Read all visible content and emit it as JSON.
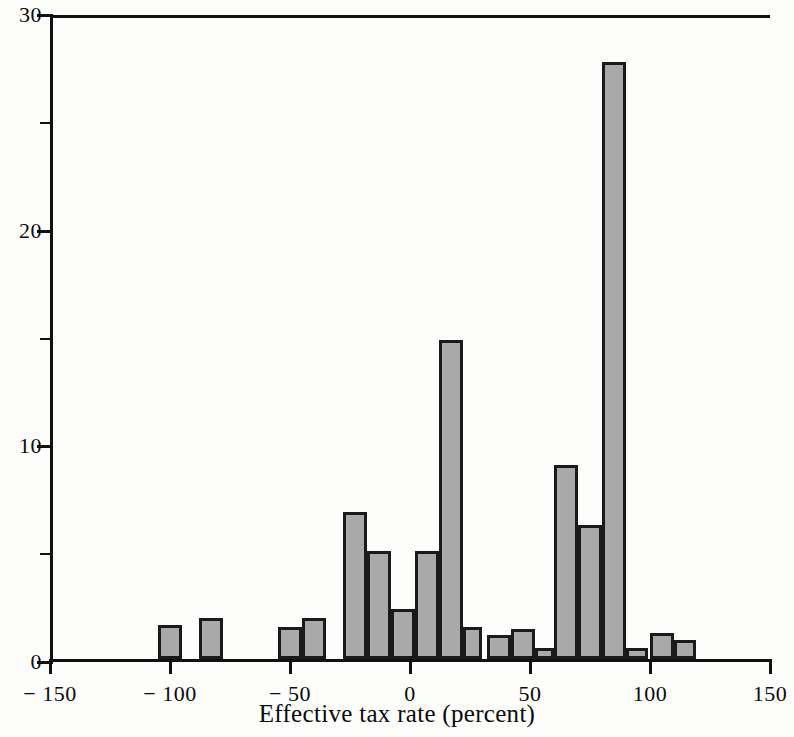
{
  "chart_data": {
    "type": "bar",
    "title": "",
    "xlabel": "Effective tax rate (percent)",
    "ylabel": "",
    "xlim": [
      -150,
      150
    ],
    "ylim": [
      0,
      30
    ],
    "grid": false,
    "legend": null,
    "bin_width": 10,
    "x_ticks": [
      {
        "value": -150,
        "label": "− 150"
      },
      {
        "value": -100,
        "label": "− 100"
      },
      {
        "value": -50,
        "label": "− 50"
      },
      {
        "value": 0,
        "label": "0"
      },
      {
        "value": 50,
        "label": "50"
      },
      {
        "value": 100,
        "label": "100"
      },
      {
        "value": 150,
        "label": "150"
      }
    ],
    "y_ticks": [
      {
        "value": 0,
        "label": "0",
        "major": true
      },
      {
        "value": 5,
        "label": "",
        "major": false
      },
      {
        "value": 10,
        "label": "10",
        "major": true
      },
      {
        "value": 15,
        "label": "",
        "major": false
      },
      {
        "value": 20,
        "label": "20",
        "major": true
      },
      {
        "value": 25,
        "label": "",
        "major": false
      },
      {
        "value": 30,
        "label": "30",
        "major": true
      }
    ],
    "bars": [
      {
        "bin_start": -105,
        "bin_end": -95,
        "value": 1.6
      },
      {
        "bin_start": -88,
        "bin_end": -78,
        "value": 1.9
      },
      {
        "bin_start": -55,
        "bin_end": -45,
        "value": 1.5
      },
      {
        "bin_start": -45,
        "bin_end": -35,
        "value": 1.9
      },
      {
        "bin_start": -28,
        "bin_end": -18,
        "value": 6.8
      },
      {
        "bin_start": -18,
        "bin_end": -8,
        "value": 5.0
      },
      {
        "bin_start": -8,
        "bin_end": 2,
        "value": 2.3
      },
      {
        "bin_start": 2,
        "bin_end": 12,
        "value": 5.0
      },
      {
        "bin_start": 12,
        "bin_end": 22,
        "value": 14.8
      },
      {
        "bin_start": 22,
        "bin_end": 30,
        "value": 1.5
      },
      {
        "bin_start": 32,
        "bin_end": 42,
        "value": 1.1
      },
      {
        "bin_start": 42,
        "bin_end": 52,
        "value": 1.4
      },
      {
        "bin_start": 52,
        "bin_end": 60,
        "value": 0.5
      },
      {
        "bin_start": 60,
        "bin_end": 70,
        "value": 9.0
      },
      {
        "bin_start": 70,
        "bin_end": 80,
        "value": 6.2
      },
      {
        "bin_start": 80,
        "bin_end": 90,
        "value": 27.7
      },
      {
        "bin_start": 90,
        "bin_end": 99,
        "value": 0.5
      },
      {
        "bin_start": 100,
        "bin_end": 110,
        "value": 1.2
      },
      {
        "bin_start": 110,
        "bin_end": 119,
        "value": 0.9
      }
    ],
    "colors": {
      "bar_fill": "#a9a9a9",
      "bar_edge": "#1a1a1a",
      "axis": "#111111",
      "background": "#fdfdfc"
    }
  }
}
